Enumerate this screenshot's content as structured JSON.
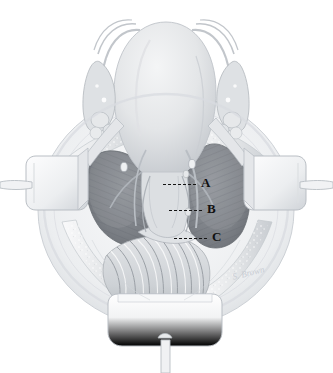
{
  "figure": {
    "background_color": "#ffffff",
    "width": 333,
    "height": 373,
    "style": "grayscale medical pen-and-ink rendering"
  },
  "labels": [
    {
      "id": "label-a",
      "text": "A",
      "x": 201,
      "y": 176,
      "leader": {
        "x": 163,
        "y": 184,
        "length": 33
      }
    },
    {
      "id": "label-b",
      "text": "B",
      "x": 207,
      "y": 202,
      "leader": {
        "x": 169,
        "y": 210,
        "length": 33
      }
    },
    {
      "id": "label-c",
      "text": "C",
      "x": 212,
      "y": 230,
      "leader": {
        "x": 174,
        "y": 238,
        "length": 33
      }
    }
  ],
  "annotation": {
    "leader_color": "#141414",
    "label_color": "#111111"
  },
  "signature": {
    "text": "S. Brown",
    "x": 232,
    "y": 268,
    "color": "#c9cdd4"
  },
  "anatomy": {
    "structures": [
      {
        "name": "uterine-fundus",
        "label": "Uterus (fundus)"
      },
      {
        "name": "fallopian-tube-left",
        "label": "Left fallopian tube"
      },
      {
        "name": "fallopian-tube-right",
        "label": "Right fallopian tube"
      },
      {
        "name": "ovary-left",
        "label": "Left ovary"
      },
      {
        "name": "ovary-right",
        "label": "Right ovary"
      },
      {
        "name": "round-ligament-left",
        "label": "Left round ligament"
      },
      {
        "name": "round-ligament-right",
        "label": "Right round ligament"
      },
      {
        "name": "pelvic-sidewall-space-left",
        "label": "Left pelvic sidewall space"
      },
      {
        "name": "pelvic-sidewall-space-right",
        "label": "Right pelvic sidewall space"
      },
      {
        "name": "cervix-lower-uterine-segment",
        "label": "Cervix / lower uterine segment"
      },
      {
        "name": "rectosigmoid-bowel",
        "label": "Rectosigmoid colon"
      },
      {
        "name": "peritoneal-incision-edge",
        "label": "Peritoneal incision edge"
      }
    ],
    "instruments": [
      {
        "name": "retractor-blade-left",
        "label": "Self-retaining retractor blade (left)"
      },
      {
        "name": "retractor-blade-right",
        "label": "Self-retaining retractor blade (right)"
      },
      {
        "name": "retractor-blade-inferior",
        "label": "Self-retaining retractor blade (inferior)"
      },
      {
        "name": "retractor-ring-frame",
        "label": "Retractor ring frame"
      }
    ]
  },
  "palette": {
    "paper": "#ffffff",
    "tissue_light": "#e9eaec",
    "tissue_mid": "#cfd2d6",
    "tissue_shadow": "#a8acb2",
    "space_dark": "#7e8288",
    "space_darker": "#6b7076",
    "outline": "#9aa0a6",
    "metal_light": "#f4f5f6",
    "metal_edge": "#bfc4c9"
  }
}
